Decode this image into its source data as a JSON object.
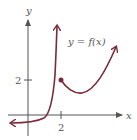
{
  "diagram": {
    "type": "function-graph",
    "function_label": "y = f(x)",
    "axes": {
      "x_label": "x",
      "y_label": "y",
      "x_ticks": [
        {
          "value": 2,
          "label": "2"
        }
      ],
      "y_ticks": [
        {
          "value": 2,
          "label": "2"
        }
      ]
    },
    "pieces": [
      {
        "name": "left-branch",
        "description": "approaches y slightly below 0 as x -> -infinity, rises steeply to +infinity as x -> 2 from the left (vertical asymptote at x = 2)"
      },
      {
        "name": "right-branch",
        "description": "starts with a closed dot at (2, ~1.8), dips to a minimum near x ~ 3, then increases to +infinity"
      }
    ],
    "point": {
      "x": 2,
      "y": 1.8,
      "style": "closed"
    },
    "colors": {
      "curve": "#7a2a3a",
      "axes": "#555555",
      "text": "#555555"
    }
  }
}
